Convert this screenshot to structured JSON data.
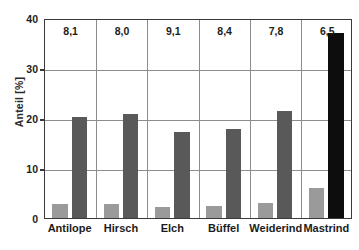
{
  "chart_data": {
    "type": "bar",
    "title": "",
    "subtitle": "",
    "xlabel": "",
    "ylabel": "Anteil [%]",
    "ylim": [
      0,
      40
    ],
    "yticks": [
      0,
      10,
      20,
      30,
      40
    ],
    "ytick_labels": [
      "0",
      "10",
      "20",
      "30",
      "40"
    ],
    "grid": true,
    "legend": "none",
    "categories": [
      "Antilope",
      "Hirsch",
      "Elch",
      "Büffel",
      "Weiderind",
      "Mastrind"
    ],
    "series": [
      {
        "name": "light-gray-series",
        "color": "#9a9a9a",
        "values": [
          2.8,
          2.9,
          2.3,
          2.4,
          3.0,
          6.0
        ]
      },
      {
        "name": "dark-gray-series",
        "color": "#595959",
        "values": [
          20.3,
          20.8,
          17.2,
          17.9,
          21.4,
          37.0
        ],
        "point_colors": [
          "#595959",
          "#595959",
          "#595959",
          "#595959",
          "#595959",
          "#0d0d0d"
        ]
      }
    ],
    "annotations": [
      "8,1",
      "8,0",
      "9,1",
      "8,4",
      "7,8",
      "6,5"
    ],
    "annotation_position": "top-of-group"
  },
  "axis": {
    "y_label": "Anteil [%]",
    "ticks": [
      {
        "value": 40,
        "label": "40"
      },
      {
        "value": 30,
        "label": "30"
      },
      {
        "value": 20,
        "label": "20"
      },
      {
        "value": 10,
        "label": "10"
      },
      {
        "value": 0,
        "label": "0"
      }
    ]
  },
  "colors": {
    "light_bar": "#9a9a9a",
    "dark_bar": "#595959",
    "black_bar": "#0d0d0d",
    "axis": "#3a3a3a",
    "grid": "#8d8d8d",
    "text": "#1c1c1c",
    "background": "#ffffff"
  }
}
